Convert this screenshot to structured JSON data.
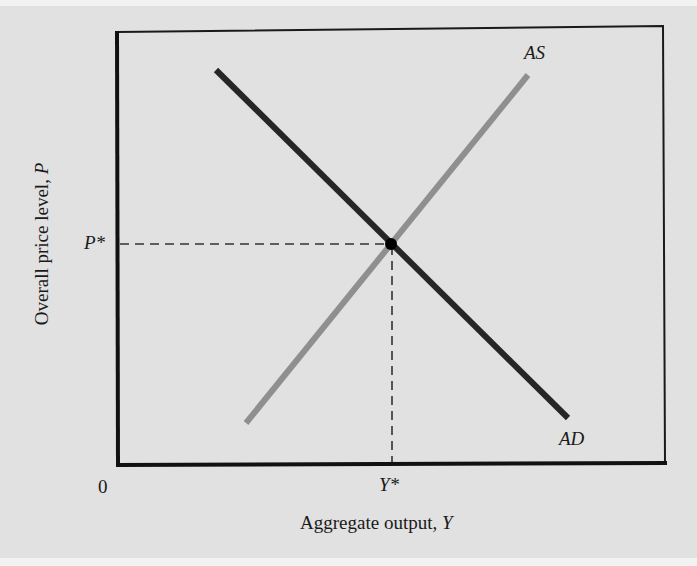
{
  "diagram": {
    "title": "",
    "axes": {
      "x_label_text": "Aggregate output, ",
      "x_label_var": "Y",
      "y_label_text": "Overall price level, ",
      "y_label_var": "P",
      "origin_label": "0"
    },
    "equilibrium": {
      "price_label": "P*",
      "output_label": "Y*"
    },
    "curves": [
      {
        "name": "AS",
        "label": "AS",
        "color": "#8f8f8f",
        "slope": "upward"
      },
      {
        "name": "AD",
        "label": "AD",
        "color": "#262626",
        "slope": "downward"
      }
    ],
    "colors": {
      "background": "#e1e1e1",
      "axis": "#111111",
      "as_curve": "#8f8f8f",
      "ad_curve": "#262626",
      "dashed_guides": "#333333",
      "equilibrium_point": "#000000"
    }
  }
}
